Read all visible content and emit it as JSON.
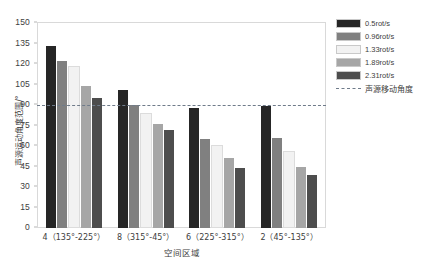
{
  "chart_data": {
    "type": "bar",
    "title": "",
    "xlabel": "空间区域",
    "ylabel": "声源运动角度范围/°",
    "ylim": [
      0,
      150
    ],
    "ytick_step": 15,
    "yticks": [
      0,
      15,
      30,
      45,
      60,
      75,
      90,
      105,
      120,
      135,
      150
    ],
    "grid": false,
    "legend_position": "right",
    "categories": [
      "4（135°-225°）",
      "8（315°-45°）",
      "6（225°-315°）",
      "2（45°-135°）"
    ],
    "series": [
      {
        "name": "0.5rot/s",
        "color": "#262626",
        "values": [
          133,
          101,
          88,
          89
        ]
      },
      {
        "name": "0.96rot/s",
        "color": "#808080",
        "values": [
          122,
          90,
          65,
          66
        ]
      },
      {
        "name": "1.33rot/s",
        "color": "#f2f2f2",
        "values": [
          117,
          83,
          59,
          55
        ]
      },
      {
        "name": "1.89rot/s",
        "color": "#a6a6a6",
        "values": [
          104,
          76,
          51,
          45
        ]
      },
      {
        "name": "2.31rot/s",
        "color": "#4d4d4d",
        "values": [
          95,
          72,
          44,
          39
        ]
      }
    ],
    "reference_line": {
      "label": "声源移动角度",
      "value": 90,
      "color": "#6f7b8a",
      "style": "dashed"
    }
  }
}
